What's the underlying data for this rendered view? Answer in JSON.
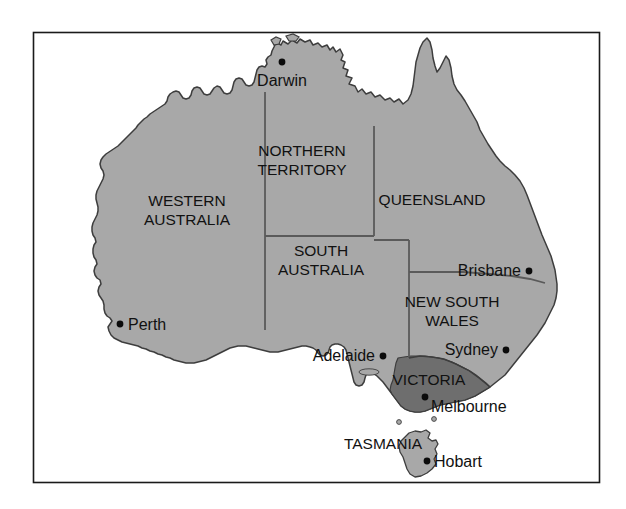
{
  "figure": {
    "frame": {
      "border_color": "#1a1a1a",
      "background_color": "#ffffff"
    }
  },
  "colors": {
    "land_fill": "#a8a8a8",
    "highlight_fill": "#6e6e6e",
    "coast_outline": "#3d3d3d",
    "state_border": "#5a5a5a",
    "label_text": "#111111",
    "city_dot": "#0b0b0b",
    "page_background": "#ffffff"
  },
  "regions": [
    {
      "id": "western-australia",
      "label": "WESTERN\nAUSTRALIA",
      "line1": "WESTERN",
      "line2": "AUSTRALIA",
      "label_x": 187,
      "label_y": 206,
      "highlighted": false
    },
    {
      "id": "northern-territory",
      "label": "NORTHERN\nTERRITORY",
      "line1": "NORTHERN",
      "line2": "TERRITORY",
      "label_x": 302,
      "label_y": 156,
      "highlighted": false
    },
    {
      "id": "queensland",
      "label": "QUEENSLAND",
      "line1": "QUEENSLAND",
      "line2": "",
      "label_x": 432,
      "label_y": 205,
      "highlighted": false
    },
    {
      "id": "south-australia",
      "label": "SOUTH\nAUSTRALIA",
      "line1": "SOUTH",
      "line2": "AUSTRALIA",
      "label_x": 321,
      "label_y": 256,
      "highlighted": false
    },
    {
      "id": "new-south-wales",
      "label": "NEW SOUTH\nWALES",
      "line1": "NEW SOUTH",
      "line2": "WALES",
      "label_x": 452,
      "label_y": 307,
      "highlighted": false
    },
    {
      "id": "victoria",
      "label": "VICTORIA",
      "line1": "VICTORIA",
      "line2": "",
      "label_x": 429,
      "label_y": 385,
      "highlighted": true
    },
    {
      "id": "tasmania",
      "label": "TASMANIA",
      "line1": "TASMANIA",
      "line2": "",
      "label_x": 383,
      "label_y": 449,
      "highlighted": false
    }
  ],
  "cities": [
    {
      "id": "darwin",
      "name": "Darwin",
      "dot_x": 282,
      "dot_y": 62,
      "label_x": 282,
      "label_y": 86,
      "label_anchor": "middle"
    },
    {
      "id": "perth",
      "name": "Perth",
      "dot_x": 120,
      "dot_y": 324,
      "label_x": 128,
      "label_y": 330,
      "label_anchor": "start"
    },
    {
      "id": "adelaide",
      "name": "Adelaide",
      "dot_x": 383,
      "dot_y": 356,
      "label_x": 375,
      "label_y": 361,
      "label_anchor": "end"
    },
    {
      "id": "brisbane",
      "name": "Brisbane",
      "dot_x": 529,
      "dot_y": 271,
      "label_x": 521,
      "label_y": 276,
      "label_anchor": "end"
    },
    {
      "id": "sydney",
      "name": "Sydney",
      "dot_x": 506,
      "dot_y": 350,
      "label_x": 498,
      "label_y": 355,
      "label_anchor": "end"
    },
    {
      "id": "melbourne",
      "name": "Melbourne",
      "dot_x": 425,
      "dot_y": 397,
      "label_x": 431,
      "label_y": 412,
      "label_anchor": "start"
    },
    {
      "id": "hobart",
      "name": "Hobart",
      "dot_x": 427,
      "dot_y": 461,
      "label_x": 434,
      "label_y": 467,
      "label_anchor": "start"
    }
  ]
}
